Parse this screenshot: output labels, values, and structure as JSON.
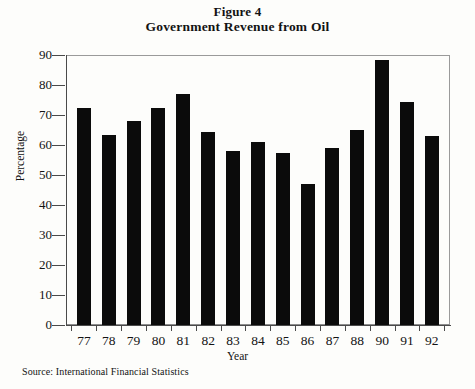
{
  "figure": {
    "title_line1": "Figure 4",
    "title_line2": "Government Revenue from Oil",
    "source": "Source: International Financial Statistics"
  },
  "axes": {
    "y_title": "Percentage",
    "x_title": "Year",
    "y_ticks": [
      "0",
      "10",
      "20",
      "30",
      "40",
      "50",
      "60",
      "70",
      "80",
      "90"
    ]
  },
  "style": {
    "bar_color": "#0b0b0b",
    "frame_color": "#8d8d8d",
    "background": "#fdfdfb"
  },
  "chart_data": {
    "type": "bar",
    "title": "Government Revenue from Oil",
    "subtitle": "Figure 4",
    "xlabel": "Year",
    "ylabel": "Percentage",
    "ylim": [
      0,
      90
    ],
    "ytick_step": 10,
    "grid": false,
    "legend": null,
    "categories": [
      "77",
      "78",
      "79",
      "80",
      "81",
      "82",
      "83",
      "84",
      "85",
      "86",
      "87",
      "88",
      "90",
      "91",
      "92"
    ],
    "values": [
      72.5,
      63.5,
      68,
      72.5,
      77,
      64.5,
      58,
      61,
      57.5,
      47,
      59,
      65,
      88.5,
      74.5,
      63
    ],
    "note": "X-axis tick labels as printed skip the year 89"
  }
}
